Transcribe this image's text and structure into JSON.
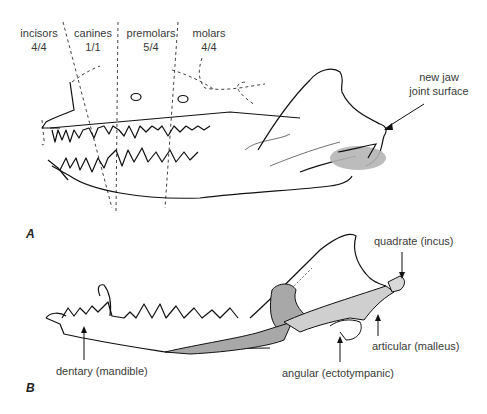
{
  "figure": {
    "panel_a": {
      "letter": "A",
      "tooth_groups": [
        {
          "name": "incisors",
          "formula": "4/4"
        },
        {
          "name": "canines",
          "formula": "1/1"
        },
        {
          "name": "premolars",
          "formula": "5/4"
        },
        {
          "name": "molars",
          "formula": "4/4"
        }
      ],
      "callouts": [
        {
          "line1": "new jaw",
          "line2": "joint surface"
        }
      ]
    },
    "panel_b": {
      "letter": "B",
      "callouts": [
        {
          "label": "quadrate (incus)"
        },
        {
          "label": "articular (malleus)"
        },
        {
          "label": "angular (ectotympanic)"
        },
        {
          "label": "dentary (mandible)"
        }
      ]
    },
    "colors": {
      "line": "#111111",
      "dashed": "#444444",
      "bone_fill": "#a8a8a8",
      "joint_fill": "#b5b5b5",
      "text": "#3a3a3a"
    }
  }
}
